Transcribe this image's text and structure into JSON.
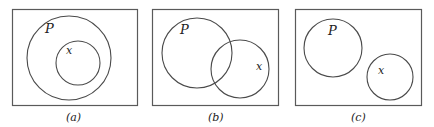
{
  "diagrams": [
    {
      "caption": "(a)",
      "relation": "x subset of P",
      "labels": {
        "outer": "P",
        "inner": "x"
      }
    },
    {
      "caption": "(b)",
      "relation": "x overlaps P",
      "labels": {
        "outer": "P",
        "inner": "x"
      }
    },
    {
      "caption": "(c)",
      "relation": "x disjoint from P",
      "labels": {
        "outer": "P",
        "inner": "x"
      }
    }
  ]
}
